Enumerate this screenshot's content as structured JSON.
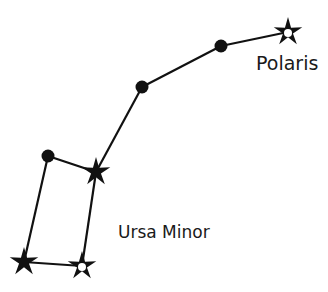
{
  "diagram": {
    "type": "constellation",
    "name": "Ursa Minor",
    "labels": {
      "constellation": "Ursa Minor",
      "polaris": "Polaris"
    },
    "colors": {
      "ink": "#111111",
      "background": "#ffffff"
    },
    "stars": [
      {
        "id": "polaris",
        "marker": "star-hollow-center",
        "named": "Polaris"
      },
      {
        "id": "s2",
        "marker": "dot"
      },
      {
        "id": "s3",
        "marker": "dot"
      },
      {
        "id": "s4",
        "marker": "star"
      },
      {
        "id": "s5",
        "marker": "dot"
      },
      {
        "id": "s6",
        "marker": "star"
      },
      {
        "id": "s7",
        "marker": "star-hollow-center"
      }
    ],
    "connections": [
      [
        "polaris",
        "s2"
      ],
      [
        "s2",
        "s3"
      ],
      [
        "s3",
        "s4"
      ],
      [
        "s4",
        "s5"
      ],
      [
        "s5",
        "s6"
      ],
      [
        "s6",
        "s7"
      ],
      [
        "s7",
        "s4"
      ]
    ]
  }
}
